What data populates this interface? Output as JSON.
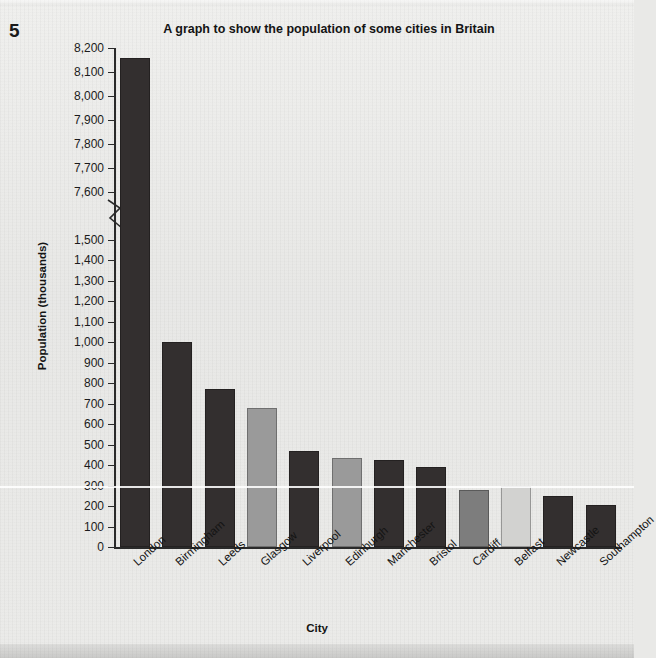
{
  "page": {
    "number": "5"
  },
  "chart_data": {
    "type": "bar",
    "title": "A graph to show the population of some cities in Britain",
    "xlabel": "City",
    "ylabel": "Population (thousands)",
    "categories": [
      "London",
      "Birmingham",
      "Leeds",
      "Glasgow",
      "Liverpool",
      "Edinburgh",
      "Manchester",
      "Bristol",
      "Cardiff",
      "Belfast",
      "Newcastle",
      "Southampton"
    ],
    "values": [
      8160,
      1000,
      770,
      680,
      470,
      435,
      425,
      390,
      280,
      300,
      250,
      205
    ],
    "bar_colors": [
      "#332f2f",
      "#332f2f",
      "#332f2f",
      "#9a9a9a",
      "#332f2f",
      "#9a9a9a",
      "#332f2f",
      "#332f2f",
      "#7d7d7d",
      "#d2d2d0",
      "#332f2f",
      "#332f2f"
    ],
    "grid": false,
    "legend": "none",
    "axis_break": true,
    "ytick_labels_upper": [
      "8,200",
      "8,100",
      "8,000",
      "7,900",
      "7,800",
      "7,700",
      "7,600"
    ],
    "ytick_values_upper": [
      8200,
      8100,
      8000,
      7900,
      7800,
      7700,
      7600
    ],
    "ytick_labels_lower": [
      "1,500",
      "1,400",
      "1,300",
      "1,200",
      "1,100",
      "1,000",
      "900",
      "800",
      "700",
      "600",
      "500",
      "400",
      "300",
      "200",
      "100",
      "0"
    ],
    "ytick_values_lower": [
      1500,
      1400,
      1300,
      1200,
      1100,
      1000,
      900,
      800,
      700,
      600,
      500,
      400,
      300,
      200,
      100,
      0
    ],
    "ylim_lower": [
      0,
      1500
    ],
    "ylim_upper": [
      7600,
      8200
    ]
  },
  "colors": {
    "bar_dark": "#332f2f",
    "bar_gray": "#9a9a9a",
    "bar_light": "#d2d2d0",
    "axis": "#2a2a2a",
    "text": "#141414",
    "background": "#e9e9e7"
  }
}
